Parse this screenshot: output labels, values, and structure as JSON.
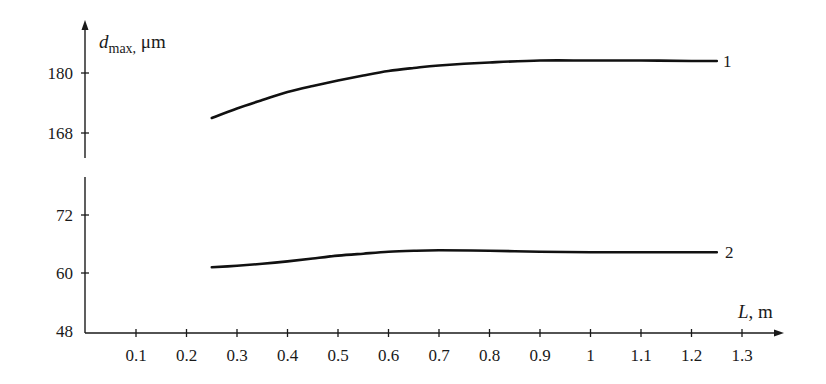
{
  "chart_data": {
    "type": "line",
    "title": "",
    "xlabel": "L, m",
    "xlabel_parts": {
      "var": "L",
      "unit": ", m"
    },
    "ylabel": "d_max, μm",
    "ylabel_parts": {
      "var": "d",
      "sub": "max,",
      "unit": " μm"
    },
    "xlim": [
      0,
      1.35
    ],
    "x_ticks": [
      0.1,
      0.2,
      0.3,
      0.4,
      0.5,
      0.6,
      0.7,
      0.8,
      0.9,
      1,
      1.1,
      1.2,
      1.3
    ],
    "x_tick_labels": [
      "0.1",
      "0.2",
      "0.3",
      "0.4",
      "0.5",
      "0.6",
      "0.7",
      "0.8",
      "0.9",
      "1",
      "1.1",
      "1.2",
      "1.3"
    ],
    "y_axis_broken": true,
    "y_segments": [
      {
        "name": "upper",
        "ylim": [
          164,
          189
        ],
        "ticks": [
          168,
          180
        ],
        "tick_labels": [
          "168",
          "180"
        ]
      },
      {
        "name": "lower",
        "ylim": [
          48,
          80
        ],
        "ticks": [
          48,
          60,
          72
        ],
        "tick_labels": [
          "48",
          "60",
          "72"
        ]
      }
    ],
    "grid": false,
    "legend": "inline labels at line ends",
    "series": [
      {
        "name": "1",
        "segment": "upper",
        "x": [
          0.25,
          0.3,
          0.35,
          0.4,
          0.45,
          0.5,
          0.55,
          0.6,
          0.65,
          0.7,
          0.8,
          0.9,
          1.0,
          1.1,
          1.2,
          1.25
        ],
        "values": [
          171.0,
          172.9,
          174.6,
          176.2,
          177.4,
          178.5,
          179.5,
          180.4,
          181.0,
          181.5,
          182.1,
          182.5,
          182.5,
          182.5,
          182.4,
          182.4
        ]
      },
      {
        "name": "2",
        "segment": "lower",
        "x": [
          0.25,
          0.3,
          0.35,
          0.4,
          0.45,
          0.5,
          0.55,
          0.6,
          0.65,
          0.7,
          0.8,
          0.9,
          1.0,
          1.1,
          1.2,
          1.25
        ],
        "values": [
          61.2,
          61.5,
          61.9,
          62.4,
          63.0,
          63.6,
          64.0,
          64.4,
          64.6,
          64.7,
          64.6,
          64.4,
          64.3,
          64.3,
          64.3,
          64.3
        ]
      }
    ]
  }
}
